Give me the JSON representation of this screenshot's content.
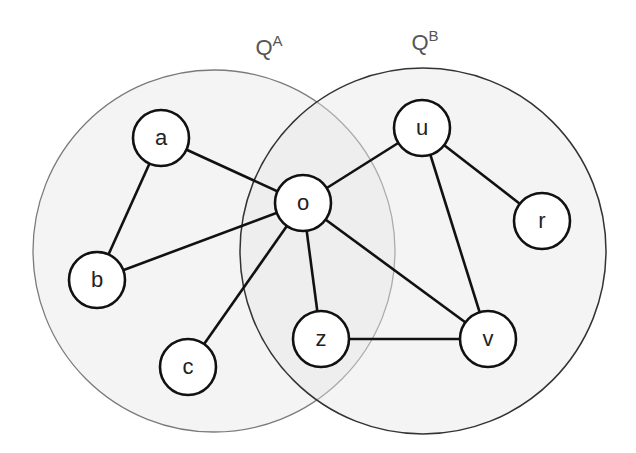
{
  "sets": [
    {
      "id": "A",
      "base": "Q",
      "sup": "A",
      "cx": 214,
      "cy": 251,
      "r": 181,
      "label_x": 269,
      "label_y": 55
    },
    {
      "id": "B",
      "base": "Q",
      "sup": "B",
      "cx": 423,
      "cy": 251,
      "r": 183,
      "label_x": 425,
      "label_y": 50
    }
  ],
  "nodes": [
    {
      "id": "a",
      "label": "a",
      "x": 161,
      "y": 138
    },
    {
      "id": "b",
      "label": "b",
      "x": 97,
      "y": 280
    },
    {
      "id": "c",
      "label": "c",
      "x": 188,
      "y": 367
    },
    {
      "id": "o",
      "label": "o",
      "x": 303,
      "y": 203
    },
    {
      "id": "u",
      "label": "u",
      "x": 422,
      "y": 128
    },
    {
      "id": "r",
      "label": "r",
      "x": 542,
      "y": 221
    },
    {
      "id": "z",
      "label": "z",
      "x": 321,
      "y": 339
    },
    {
      "id": "v",
      "label": "v",
      "x": 488,
      "y": 339
    }
  ],
  "edges": [
    [
      "a",
      "b"
    ],
    [
      "a",
      "o"
    ],
    [
      "b",
      "o"
    ],
    [
      "c",
      "o"
    ],
    [
      "o",
      "u"
    ],
    [
      "o",
      "z"
    ],
    [
      "o",
      "v"
    ],
    [
      "u",
      "r"
    ],
    [
      "u",
      "v"
    ],
    [
      "z",
      "v"
    ]
  ],
  "node_radius": 28,
  "colors": {
    "background": "#ffffff",
    "edge": "#111111",
    "node_fill": "#ffffff",
    "set_label": "#555555"
  }
}
